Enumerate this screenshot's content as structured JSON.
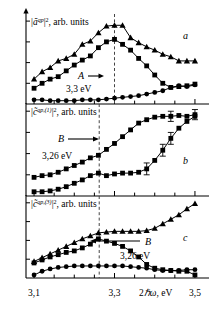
{
  "figure": {
    "panel_letters": [
      "a",
      "b",
      "c"
    ],
    "xaxis": {
      "label": "2ℏω, eV",
      "ticks": [
        "3,1",
        "3,3",
        "3,5"
      ],
      "tick_values": [
        3.1,
        3.3,
        3.5
      ],
      "min": 3.08,
      "max": 3.52,
      "minor_step": 0.05
    },
    "panels": [
      {
        "id": "a",
        "letter": "a",
        "ylabel_parts": {
          "pre": "|",
          "sym": "ã",
          "sup": "qp",
          "post": "|",
          "sq": "2",
          "tail": ", arb. units"
        },
        "ylabel_text": "|ãqp|2, arb. units",
        "marker_line": {
          "value": 3.3,
          "style": "dashed"
        },
        "annotation": {
          "name": "A",
          "arrow": "right",
          "energy": "3,3 eV"
        }
      },
      {
        "id": "b",
        "letter": "b",
        "ylabel_parts": {
          "pre": "|",
          "sym": "c̃",
          "sup": "qp,(1)",
          "post": "|",
          "sq": "2",
          "tail": ", arb. units"
        },
        "ylabel_text": "|c̃qp,(1)|2, arb. units",
        "marker_line": {
          "value": 3.262,
          "style": "dashed"
        },
        "annotation": {
          "name": "B",
          "arrow": "right",
          "energy": "3,26 eV"
        }
      },
      {
        "id": "c",
        "letter": "c",
        "ylabel_parts": {
          "pre": "|",
          "sym": "c̃",
          "sup": "qp,(3)",
          "post": "|",
          "sq": "2",
          "tail": ", arb. units"
        },
        "ylabel_text": "|c̃qp,(3)|2, arb. units",
        "marker_line": {
          "value": 3.262,
          "style": "dashed"
        },
        "annotation": {
          "name": "B",
          "arrow": "left",
          "energy": "3,26 eV"
        }
      }
    ]
  },
  "chart_data": [
    {
      "type": "line",
      "panel": "a",
      "title": "",
      "xlabel": "2ℏω, eV",
      "ylabel": "|ãqp|2, arb. units",
      "xlim": [
        3.08,
        3.52
      ],
      "ylim": [
        0,
        1.05
      ],
      "grid": false,
      "legend": "none",
      "annotations": [
        {
          "text": "A",
          "energy_label": "3,3 eV",
          "x": 3.3,
          "arrow": "right"
        }
      ],
      "series": [
        {
          "name": "triangles",
          "marker": "triangle",
          "x": [
            3.1,
            3.12,
            3.14,
            3.16,
            3.18,
            3.2,
            3.22,
            3.24,
            3.26,
            3.28,
            3.3,
            3.32,
            3.34,
            3.36,
            3.38,
            3.4,
            3.42,
            3.44,
            3.46,
            3.48,
            3.5
          ],
          "y": [
            0.3,
            0.39,
            0.44,
            0.52,
            0.55,
            0.6,
            0.72,
            0.76,
            0.86,
            0.94,
            0.95,
            0.95,
            0.8,
            0.74,
            0.69,
            0.65,
            0.6,
            0.57,
            0.52,
            0.52,
            0.52
          ]
        },
        {
          "name": "squares",
          "marker": "square",
          "x": [
            3.1,
            3.12,
            3.14,
            3.16,
            3.18,
            3.2,
            3.22,
            3.24,
            3.26,
            3.28,
            3.3,
            3.32,
            3.34,
            3.36,
            3.38,
            3.4,
            3.42,
            3.44,
            3.46,
            3.48,
            3.5
          ],
          "y": [
            0.19,
            0.25,
            0.3,
            0.33,
            0.4,
            0.47,
            0.53,
            0.58,
            0.68,
            0.75,
            0.78,
            0.72,
            0.65,
            0.55,
            0.46,
            0.35,
            0.25,
            0.2,
            0.21,
            0.22,
            0.24
          ]
        },
        {
          "name": "circles",
          "marker": "circle",
          "x": [
            3.1,
            3.12,
            3.14,
            3.16,
            3.18,
            3.2,
            3.22,
            3.24,
            3.26,
            3.28,
            3.3,
            3.32,
            3.34,
            3.36,
            3.38,
            3.4,
            3.42,
            3.44,
            3.46,
            3.48,
            3.5
          ],
          "y": [
            0.05,
            0.05,
            0.04,
            0.04,
            0.04,
            0.04,
            0.05,
            0.05,
            0.05,
            0.06,
            0.07,
            0.08,
            0.09,
            0.1,
            0.12,
            0.14,
            0.16,
            0.2,
            0.22,
            0.21,
            0.23
          ]
        }
      ]
    },
    {
      "type": "line",
      "panel": "b",
      "title": "",
      "xlabel": "2ℏω, eV",
      "ylabel": "|c̃qp,(1)|2, arb. units",
      "xlim": [
        3.08,
        3.52
      ],
      "ylim": [
        0,
        1.05
      ],
      "grid": false,
      "legend": "none",
      "annotations": [
        {
          "text": "B",
          "energy_label": "3,26 eV",
          "x": 3.262,
          "arrow": "right"
        }
      ],
      "series": [
        {
          "name": "squares-upper",
          "marker": "square",
          "x": [
            3.1,
            3.12,
            3.14,
            3.16,
            3.18,
            3.2,
            3.22,
            3.24,
            3.26,
            3.28,
            3.3,
            3.32,
            3.34,
            3.36,
            3.38,
            3.4,
            3.42,
            3.44,
            3.46,
            3.48,
            3.5
          ],
          "y": [
            0.22,
            0.24,
            0.25,
            0.28,
            0.32,
            0.36,
            0.4,
            0.45,
            0.48,
            0.55,
            0.62,
            0.7,
            0.78,
            0.86,
            0.9,
            0.93,
            0.94,
            0.94,
            0.95,
            0.94,
            0.96
          ],
          "errorbars": [
            {
              "x": 3.44,
              "y": 0.94,
              "err": 0.06
            },
            {
              "x": 3.5,
              "y": 0.96,
              "err": 0.06
            }
          ]
        },
        {
          "name": "squares-lower",
          "marker": "square",
          "x": [
            3.1,
            3.12,
            3.14,
            3.16,
            3.18,
            3.2,
            3.22,
            3.24,
            3.26,
            3.28,
            3.3,
            3.32,
            3.34,
            3.36,
            3.38,
            3.4,
            3.42,
            3.44,
            3.46,
            3.48,
            3.5
          ],
          "y": [
            0.05,
            0.05,
            0.06,
            0.08,
            0.11,
            0.15,
            0.19,
            0.24,
            0.27,
            0.24,
            0.26,
            0.27,
            0.27,
            0.28,
            0.32,
            0.42,
            0.54,
            0.68,
            0.8,
            0.88,
            0.94
          ],
          "errorbars": [
            {
              "x": 3.38,
              "y": 0.32,
              "err": 0.07
            },
            {
              "x": 3.42,
              "y": 0.54,
              "err": 0.07
            },
            {
              "x": 3.44,
              "y": 0.68,
              "err": 0.07
            }
          ]
        }
      ]
    },
    {
      "type": "line",
      "panel": "c",
      "title": "",
      "xlabel": "2ℏω, eV",
      "ylabel": "|c̃qp,(3)|2, arb. units",
      "xlim": [
        3.08,
        3.52
      ],
      "ylim": [
        0,
        1.05
      ],
      "grid": false,
      "legend": "none",
      "annotations": [
        {
          "text": "B",
          "energy_label": "3,26 eV",
          "x": 3.262,
          "arrow": "left"
        }
      ],
      "series": [
        {
          "name": "triangles",
          "marker": "triangle",
          "x": [
            3.1,
            3.12,
            3.14,
            3.16,
            3.18,
            3.2,
            3.22,
            3.24,
            3.26,
            3.28,
            3.3,
            3.32,
            3.34,
            3.36,
            3.38,
            3.4,
            3.42,
            3.44,
            3.46,
            3.48,
            3.5
          ],
          "y": [
            0.22,
            0.27,
            0.32,
            0.37,
            0.42,
            0.47,
            0.52,
            0.56,
            0.6,
            0.61,
            0.62,
            0.62,
            0.62,
            0.62,
            0.63,
            0.66,
            0.72,
            0.78,
            0.84,
            0.92,
            0.99
          ]
        },
        {
          "name": "squares",
          "marker": "square",
          "x": [
            3.1,
            3.12,
            3.14,
            3.16,
            3.18,
            3.2,
            3.22,
            3.24,
            3.26,
            3.28,
            3.3,
            3.32,
            3.34,
            3.36,
            3.38,
            3.4,
            3.42,
            3.44,
            3.46,
            3.48,
            3.5
          ],
          "y": [
            0.2,
            0.24,
            0.28,
            0.31,
            0.34,
            0.36,
            0.4,
            0.45,
            0.52,
            0.49,
            0.46,
            0.42,
            0.36,
            0.28,
            0.18,
            0.13,
            0.11,
            0.1,
            0.09,
            0.09,
            0.04
          ]
        },
        {
          "name": "circles",
          "marker": "circle",
          "x": [
            3.1,
            3.12,
            3.14,
            3.16,
            3.18,
            3.2,
            3.22,
            3.24,
            3.26,
            3.28,
            3.3,
            3.32,
            3.34,
            3.36,
            3.38,
            3.4,
            3.42,
            3.44,
            3.46,
            3.48,
            3.5
          ],
          "y": [
            0.04,
            0.09,
            0.12,
            0.14,
            0.15,
            0.16,
            0.16,
            0.16,
            0.16,
            0.16,
            0.16,
            0.16,
            0.15,
            0.14,
            0.13,
            0.11,
            0.1,
            0.1,
            0.1,
            0.11,
            0.11
          ]
        }
      ]
    }
  ]
}
